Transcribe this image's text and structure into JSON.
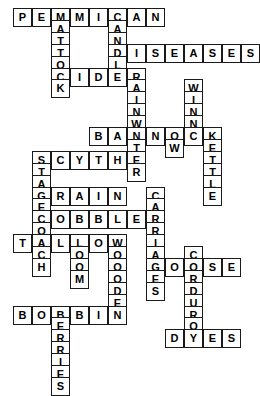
{
  "page": {
    "header_fragment": "",
    "background_color": "#ffffff",
    "cell_border_color": "#1a1a1a",
    "letter_color": "#000000"
  },
  "grid": {
    "cell_size_px": 19,
    "origin_x_px": 13,
    "origin_y_px": 8,
    "columns": 13,
    "rows": 25
  },
  "entries": [
    {
      "answer": "PEMMICAN",
      "direction": "across",
      "row": 0,
      "col": 0
    },
    {
      "answer": "MATTOCK",
      "direction": "down",
      "row": 0,
      "col": 2
    },
    {
      "answer": "CANDLE",
      "direction": "down",
      "row": 0,
      "col": 5
    },
    {
      "answer": "RAINWATER",
      "direction": "down",
      "row": 3,
      "col": 6
    },
    {
      "answer": "DISEASES",
      "direction": "across",
      "row": 3,
      "col": 5
    },
    {
      "answer": "CIDER",
      "direction": "across",
      "row": 5,
      "col": 2
    },
    {
      "answer": "WINNOW",
      "direction": "down",
      "row": 4,
      "col": 9
    },
    {
      "answer": "BANNOCK",
      "direction": "across",
      "row": 7,
      "col": 4
    },
    {
      "answer": "KETTLE",
      "direction": "down",
      "row": 7,
      "col": 10
    },
    {
      "answer": "SCYTHE",
      "direction": "across",
      "row": 8,
      "col": 1
    },
    {
      "answer": "STAGECOACH",
      "direction": "down",
      "row": 8,
      "col": 1
    },
    {
      "answer": "GRAIN",
      "direction": "across",
      "row": 10,
      "col": 1
    },
    {
      "answer": "COBBLER",
      "direction": "across",
      "row": 12,
      "col": 1
    },
    {
      "answer": "TALLOW",
      "direction": "across",
      "row": 14,
      "col": 0
    },
    {
      "answer": "LOOM",
      "direction": "down",
      "row": 14,
      "col": 3
    },
    {
      "answer": "WOODEN",
      "direction": "down",
      "row": 14,
      "col": 5
    },
    {
      "answer": "CARRIAGES",
      "direction": "down",
      "row": 11,
      "col": 6
    },
    {
      "answer": "GOOSE",
      "direction": "across",
      "row": 17,
      "col": 6
    },
    {
      "answer": "CORDUROY",
      "direction": "down",
      "row": 16,
      "col": 8
    },
    {
      "answer": "BOBBIN",
      "direction": "across",
      "row": 20,
      "col": 0
    },
    {
      "answer": "BERRIES",
      "direction": "down",
      "row": 20,
      "col": 2
    },
    {
      "answer": "DYES",
      "direction": "across",
      "row": 24,
      "col": 6
    }
  ],
  "cells": [
    {
      "row": 0,
      "col": 0,
      "letter": "P"
    },
    {
      "row": 0,
      "col": 1,
      "letter": "E"
    },
    {
      "row": 0,
      "col": 2,
      "letter": "M"
    },
    {
      "row": 0,
      "col": 3,
      "letter": "M"
    },
    {
      "row": 0,
      "col": 4,
      "letter": "I"
    },
    {
      "row": 0,
      "col": 5,
      "letter": "C"
    },
    {
      "row": 0,
      "col": 6,
      "letter": "A"
    },
    {
      "row": 0,
      "col": 7,
      "letter": "N"
    },
    {
      "row": 1,
      "col": 2,
      "letter": "A"
    },
    {
      "row": 1,
      "col": 5,
      "letter": "A"
    },
    {
      "row": 2,
      "col": 2,
      "letter": "T"
    },
    {
      "row": 2,
      "col": 5,
      "letter": "N"
    },
    {
      "row": 3,
      "col": 2,
      "letter": "T"
    },
    {
      "row": 3,
      "col": 5,
      "letter": "D"
    },
    {
      "row": 3,
      "col": 6,
      "letter": "I"
    },
    {
      "row": 3,
      "col": 7,
      "letter": "S"
    },
    {
      "row": 3,
      "col": 8,
      "letter": "E"
    },
    {
      "row": 3,
      "col": 9,
      "letter": "A"
    },
    {
      "row": 3,
      "col": 10,
      "letter": "S"
    },
    {
      "row": 3,
      "col": 11,
      "letter": "E"
    },
    {
      "row": 3,
      "col": 12,
      "letter": "S"
    },
    {
      "row": 4,
      "col": 2,
      "letter": "O"
    },
    {
      "row": 4,
      "col": 5,
      "letter": "L"
    },
    {
      "row": 5,
      "col": 2,
      "letter": "C"
    },
    {
      "row": 5,
      "col": 3,
      "letter": "I"
    },
    {
      "row": 5,
      "col": 4,
      "letter": "D"
    },
    {
      "row": 5,
      "col": 5,
      "letter": "E"
    },
    {
      "row": 5,
      "col": 6,
      "letter": "R"
    },
    {
      "row": 6,
      "col": 2,
      "letter": "K"
    },
    {
      "row": 6,
      "col": 6,
      "letter": "A"
    },
    {
      "row": 6,
      "col": 9,
      "letter": "W"
    },
    {
      "row": 7,
      "col": 6,
      "letter": "I"
    },
    {
      "row": 7,
      "col": 9,
      "letter": "I"
    },
    {
      "row": 8,
      "col": 6,
      "letter": "N"
    },
    {
      "row": 8,
      "col": 9,
      "letter": "N"
    },
    {
      "row": 9,
      "col": 6,
      "letter": "W"
    },
    {
      "row": 9,
      "col": 9,
      "letter": "N"
    },
    {
      "row": 10,
      "col": 4,
      "letter": "B"
    },
    {
      "row": 10,
      "col": 5,
      "letter": "A"
    },
    {
      "row": 10,
      "col": 6,
      "letter": "N"
    },
    {
      "row": 10,
      "col": 7,
      "letter": "N"
    },
    {
      "row": 10,
      "col": 8,
      "letter": "O"
    },
    {
      "row": 10,
      "col": 9,
      "letter": "C"
    },
    {
      "row": 10,
      "col": 10,
      "letter": "K"
    },
    {
      "row": 11,
      "col": 6,
      "letter": "T"
    },
    {
      "row": 11,
      "col": 8,
      "letter": "W"
    },
    {
      "row": 11,
      "col": 10,
      "letter": "E"
    },
    {
      "row": 12,
      "col": 1,
      "letter": "S"
    },
    {
      "row": 12,
      "col": 2,
      "letter": "C"
    },
    {
      "row": 12,
      "col": 3,
      "letter": "Y"
    },
    {
      "row": 12,
      "col": 4,
      "letter": "T"
    },
    {
      "row": 12,
      "col": 5,
      "letter": "H"
    },
    {
      "row": 12,
      "col": 6,
      "letter": "E"
    },
    {
      "row": 12,
      "col": 10,
      "letter": "T"
    },
    {
      "row": 13,
      "col": 1,
      "letter": "T"
    },
    {
      "row": 13,
      "col": 6,
      "letter": "R"
    },
    {
      "row": 13,
      "col": 10,
      "letter": "T"
    },
    {
      "row": 14,
      "col": 1,
      "letter": "A"
    },
    {
      "row": 14,
      "col": 10,
      "letter": "L"
    },
    {
      "row": 15,
      "col": 1,
      "letter": "G"
    },
    {
      "row": 15,
      "col": 2,
      "letter": "R"
    },
    {
      "row": 15,
      "col": 3,
      "letter": "A"
    },
    {
      "row": 15,
      "col": 4,
      "letter": "I"
    },
    {
      "row": 15,
      "col": 5,
      "letter": "N"
    },
    {
      "row": 15,
      "col": 7,
      "letter": "C"
    },
    {
      "row": 15,
      "col": 10,
      "letter": "E"
    },
    {
      "row": 16,
      "col": 1,
      "letter": "E"
    },
    {
      "row": 16,
      "col": 7,
      "letter": "A"
    },
    {
      "row": 17,
      "col": 1,
      "letter": "C"
    },
    {
      "row": 17,
      "col": 2,
      "letter": "O"
    },
    {
      "row": 17,
      "col": 3,
      "letter": "B"
    },
    {
      "row": 17,
      "col": 4,
      "letter": "B"
    },
    {
      "row": 17,
      "col": 5,
      "letter": "L"
    },
    {
      "row": 17,
      "col": 6,
      "letter": "E"
    },
    {
      "row": 17,
      "col": 7,
      "letter": "R"
    },
    {
      "row": 18,
      "col": 1,
      "letter": "O"
    },
    {
      "row": 18,
      "col": 7,
      "letter": "R"
    },
    {
      "row": 19,
      "col": 0,
      "letter": "T"
    },
    {
      "row": 19,
      "col": 1,
      "letter": "A"
    },
    {
      "row": 19,
      "col": 2,
      "letter": "L"
    },
    {
      "row": 19,
      "col": 3,
      "letter": "L"
    },
    {
      "row": 19,
      "col": 4,
      "letter": "O"
    },
    {
      "row": 19,
      "col": 5,
      "letter": "W"
    },
    {
      "row": 19,
      "col": 7,
      "letter": "I"
    },
    {
      "row": 20,
      "col": 1,
      "letter": "C"
    },
    {
      "row": 20,
      "col": 3,
      "letter": "O"
    },
    {
      "row": 20,
      "col": 5,
      "letter": "O"
    },
    {
      "row": 20,
      "col": 7,
      "letter": "A"
    },
    {
      "row": 20,
      "col": 9,
      "letter": "C"
    },
    {
      "row": 21,
      "col": 1,
      "letter": "H"
    },
    {
      "row": 21,
      "col": 3,
      "letter": "O"
    },
    {
      "row": 21,
      "col": 5,
      "letter": "O"
    },
    {
      "row": 21,
      "col": 7,
      "letter": "G"
    },
    {
      "row": 21,
      "col": 8,
      "letter": "O"
    },
    {
      "row": 21,
      "col": 9,
      "letter": "O"
    },
    {
      "row": 21,
      "col": 10,
      "letter": "S"
    },
    {
      "row": 21,
      "col": 11,
      "letter": "E"
    },
    {
      "row": 22,
      "col": 3,
      "letter": "M"
    },
    {
      "row": 22,
      "col": 5,
      "letter": "O"
    },
    {
      "row": 22,
      "col": 7,
      "letter": "E"
    },
    {
      "row": 22,
      "col": 9,
      "letter": "R"
    },
    {
      "row": 23,
      "col": 5,
      "letter": "D"
    },
    {
      "row": 23,
      "col": 7,
      "letter": "S"
    },
    {
      "row": 23,
      "col": 9,
      "letter": "D"
    },
    {
      "row": 24,
      "col": 5,
      "letter": "E"
    },
    {
      "row": 24,
      "col": 9,
      "letter": "U"
    },
    {
      "row": 25,
      "col": 0,
      "letter": "B"
    },
    {
      "row": 25,
      "col": 1,
      "letter": "O"
    },
    {
      "row": 25,
      "col": 2,
      "letter": "B"
    },
    {
      "row": 25,
      "col": 3,
      "letter": "B"
    },
    {
      "row": 25,
      "col": 4,
      "letter": "I"
    },
    {
      "row": 25,
      "col": 5,
      "letter": "N"
    },
    {
      "row": 25,
      "col": 9,
      "letter": "R"
    },
    {
      "row": 26,
      "col": 2,
      "letter": "E"
    },
    {
      "row": 26,
      "col": 9,
      "letter": "O"
    },
    {
      "row": 27,
      "col": 2,
      "letter": "R"
    },
    {
      "row": 27,
      "col": 8,
      "letter": "D"
    },
    {
      "row": 27,
      "col": 9,
      "letter": "Y"
    },
    {
      "row": 27,
      "col": 10,
      "letter": "E"
    },
    {
      "row": 27,
      "col": 11,
      "letter": "S"
    },
    {
      "row": 28,
      "col": 2,
      "letter": "R"
    },
    {
      "row": 29,
      "col": 2,
      "letter": "I"
    },
    {
      "row": 30,
      "col": 2,
      "letter": "E"
    },
    {
      "row": 31,
      "col": 2,
      "letter": "S"
    }
  ]
}
